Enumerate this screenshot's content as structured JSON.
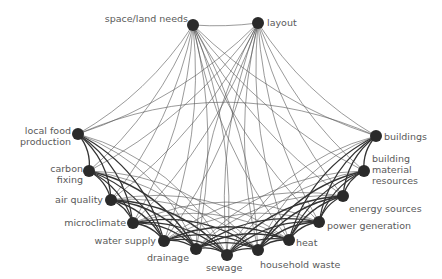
{
  "diagram": {
    "title": "",
    "nodes": [
      {
        "id": "space_land",
        "label": "space/land needs",
        "x": 193,
        "y": 25,
        "lx": 70,
        "ly": 13,
        "align": "right",
        "w": 118
      },
      {
        "id": "layout",
        "label": "layout",
        "x": 258,
        "y": 23,
        "lx": 267,
        "ly": 17,
        "align": "left",
        "w": 50
      },
      {
        "id": "local_food",
        "label": "local food\nproduction",
        "x": 78,
        "y": 134,
        "lx": 0,
        "ly": 125,
        "align": "right",
        "w": 71
      },
      {
        "id": "carbon",
        "label": "carbon\nfixing",
        "x": 89,
        "y": 171,
        "lx": 40,
        "ly": 163,
        "align": "right",
        "w": 43
      },
      {
        "id": "air",
        "label": "air quality",
        "x": 111,
        "y": 200,
        "lx": 40,
        "ly": 194,
        "align": "right",
        "w": 63
      },
      {
        "id": "micro",
        "label": "microclimate",
        "x": 133,
        "y": 223,
        "lx": 50,
        "ly": 217,
        "align": "right",
        "w": 76
      },
      {
        "id": "water",
        "label": "water supply",
        "x": 164,
        "y": 241,
        "lx": 80,
        "ly": 235,
        "align": "right",
        "w": 76
      },
      {
        "id": "drainage",
        "label": "drainage",
        "x": 196,
        "y": 249,
        "lx": 135,
        "ly": 252,
        "align": "right",
        "w": 54
      },
      {
        "id": "sewage",
        "label": "sewage",
        "x": 227,
        "y": 255,
        "lx": 206,
        "ly": 262,
        "align": "left",
        "w": 50
      },
      {
        "id": "household",
        "label": "household waste",
        "x": 258,
        "y": 250,
        "lx": 260,
        "ly": 259,
        "align": "left",
        "w": 100
      },
      {
        "id": "heat",
        "label": "heat",
        "x": 289,
        "y": 240,
        "lx": 296,
        "ly": 237,
        "align": "left",
        "w": 30
      },
      {
        "id": "power",
        "label": "power generation",
        "x": 319,
        "y": 222,
        "lx": 327,
        "ly": 220,
        "align": "left",
        "w": 100
      },
      {
        "id": "energy",
        "label": "energy sources",
        "x": 343,
        "y": 196,
        "lx": 349,
        "ly": 203,
        "align": "left",
        "w": 92
      },
      {
        "id": "bmr",
        "label": "building\nmaterial\nresources",
        "x": 364,
        "y": 171,
        "lx": 372,
        "ly": 153,
        "align": "left",
        "w": 60
      },
      {
        "id": "buildings",
        "label": "buildings",
        "x": 376,
        "y": 136,
        "lx": 384,
        "ly": 131,
        "align": "left",
        "w": 58
      }
    ],
    "top_nodes": [
      "space_land",
      "layout"
    ],
    "edge_style": {
      "top_color": "#555555",
      "ring_color": "#333333",
      "node_color": "#2a2a2a",
      "label_color": "#5a5a5a"
    }
  }
}
